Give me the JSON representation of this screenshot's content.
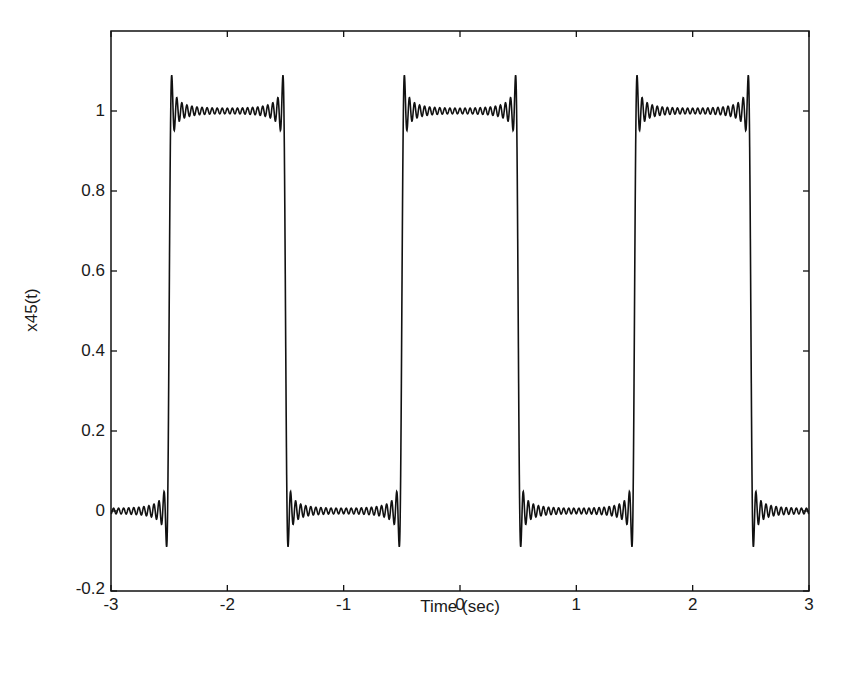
{
  "chart_data": {
    "type": "line",
    "title": "",
    "xlabel": "Time (sec)",
    "ylabel": "x45(t)",
    "xlim": [
      -3,
      3
    ],
    "ylim": [
      -0.2,
      1.2
    ],
    "xticks": [
      -3,
      -2,
      -1,
      0,
      1,
      2,
      3
    ],
    "xtick_labels": [
      "-3",
      "-2",
      "-1",
      "0",
      "1",
      "2",
      "3"
    ],
    "yticks": [
      -0.2,
      0,
      0.2,
      0.4,
      0.6,
      0.8,
      1
    ],
    "ytick_labels": [
      "-0.2",
      "0",
      "0.2",
      "0.4",
      "0.6",
      "0.8",
      "1"
    ],
    "grid": false,
    "legend": null,
    "series": [
      {
        "name": "x45(t)",
        "description": "Fourier series approximation (45 harmonics) of a square wave with period 2 s, high (1) on |t|<0.5, low (0) otherwise; Gibbs overshoot ~1.09 and undershoot ~-0.09 at discontinuities",
        "period": 2,
        "harmonics": 45,
        "transitions": [
          -2.5,
          -1.5,
          -0.5,
          0.5,
          1.5,
          2.5
        ],
        "levels": {
          "high": 1,
          "low": 0
        },
        "overshoot_max": 1.09,
        "undershoot_min": -0.09,
        "color": "#111111"
      }
    ]
  }
}
